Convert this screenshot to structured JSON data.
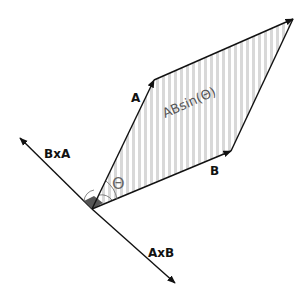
{
  "diagram": {
    "labels": {
      "vector_a": "A",
      "vector_b": "B",
      "a_cross_b": "AxB",
      "b_cross_a": "BxA",
      "area": "ABsin(Θ)",
      "angle": "Θ"
    },
    "colors": {
      "line": "#111111",
      "hatch": "#d8d8d8",
      "right_angle_fill": "#555555",
      "label_gray": "#555555"
    },
    "points": {
      "origin": [
        92,
        209
      ],
      "a_tip": [
        154,
        80
      ],
      "b_tip": [
        231,
        151
      ],
      "far_corner": [
        293,
        19
      ],
      "bxa_tip": [
        20,
        138
      ],
      "axb_tip": [
        175,
        283
      ]
    }
  }
}
